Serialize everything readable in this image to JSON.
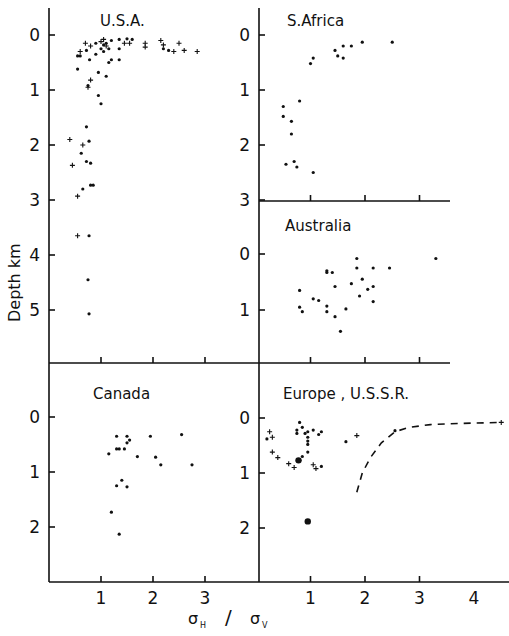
{
  "chart_data": {
    "type": "scatter",
    "title": "",
    "xlabel": "σH / σV",
    "ylabel": "Depth km",
    "marker_legend": {
      "dot": "measurement (•)",
      "cross": "measurement (+)"
    },
    "panels": [
      {
        "name": "U.S.A.",
        "xlim": [
          0,
          3.8
        ],
        "ylim": [
          0,
          6
        ],
        "xticks": [
          1,
          2,
          3
        ],
        "yticks": [
          0,
          1,
          2,
          3,
          4,
          5
        ],
        "dots": [
          [
            0.55,
            0.38
          ],
          [
            0.6,
            0.38
          ],
          [
            0.72,
            0.28
          ],
          [
            0.78,
            0.45
          ],
          [
            0.9,
            0.35
          ],
          [
            1.05,
            0.3
          ],
          [
            1.0,
            0.25
          ],
          [
            1.1,
            0.15
          ],
          [
            1.2,
            0.1
          ],
          [
            1.35,
            0.08
          ],
          [
            1.5,
            0.07
          ],
          [
            1.6,
            0.08
          ],
          [
            1.15,
            0.5
          ],
          [
            1.2,
            0.45
          ],
          [
            1.35,
            0.45
          ],
          [
            0.55,
            0.62
          ],
          [
            0.75,
            0.92
          ],
          [
            0.95,
            0.68
          ],
          [
            1.1,
            0.75
          ],
          [
            0.95,
            1.1
          ],
          [
            1.0,
            1.25
          ],
          [
            0.72,
            1.67
          ],
          [
            0.77,
            1.93
          ],
          [
            0.62,
            2.15
          ],
          [
            0.72,
            2.3
          ],
          [
            0.8,
            2.33
          ],
          [
            0.65,
            2.8
          ],
          [
            0.8,
            2.73
          ],
          [
            0.85,
            2.73
          ],
          [
            0.77,
            3.65
          ],
          [
            0.75,
            4.45
          ],
          [
            0.77,
            5.07
          ],
          [
            1.15,
            0.25
          ],
          [
            1.35,
            0.25
          ],
          [
            0.9,
            0.15
          ],
          [
            1.05,
            0.18
          ],
          [
            2.2,
            0.25
          ],
          [
            2.3,
            0.28
          ]
        ],
        "crosses": [
          [
            0.6,
            0.3
          ],
          [
            0.7,
            0.15
          ],
          [
            0.8,
            0.2
          ],
          [
            1.0,
            0.12
          ],
          [
            1.05,
            0.08
          ],
          [
            1.1,
            0.2
          ],
          [
            1.45,
            0.15
          ],
          [
            1.55,
            0.15
          ],
          [
            1.85,
            0.15
          ],
          [
            1.85,
            0.22
          ],
          [
            2.15,
            0.1
          ],
          [
            2.2,
            0.18
          ],
          [
            2.4,
            0.3
          ],
          [
            2.5,
            0.15
          ],
          [
            2.6,
            0.28
          ],
          [
            2.85,
            0.3
          ],
          [
            0.8,
            0.82
          ],
          [
            0.75,
            0.95
          ],
          [
            0.4,
            1.9
          ],
          [
            0.65,
            2.0
          ],
          [
            0.45,
            2.37
          ],
          [
            0.55,
            2.93
          ],
          [
            0.55,
            3.65
          ]
        ]
      },
      {
        "name": "S.Africa",
        "xlim": [
          0,
          3.5
        ],
        "ylim": [
          0,
          3
        ],
        "xticks": [
          1,
          2,
          3
        ],
        "yticks": [
          0,
          1,
          2,
          3
        ],
        "dots": [
          [
            0.5,
            1.3
          ],
          [
            0.5,
            1.48
          ],
          [
            0.65,
            1.57
          ],
          [
            0.65,
            1.8
          ],
          [
            0.8,
            1.2
          ],
          [
            1.0,
            0.52
          ],
          [
            1.05,
            0.42
          ],
          [
            1.45,
            0.28
          ],
          [
            1.5,
            0.38
          ],
          [
            1.6,
            0.2
          ],
          [
            1.6,
            0.42
          ],
          [
            1.75,
            0.2
          ],
          [
            1.95,
            0.13
          ],
          [
            2.5,
            0.13
          ],
          [
            0.55,
            2.35
          ],
          [
            0.7,
            2.3
          ],
          [
            0.75,
            2.4
          ],
          [
            1.05,
            2.5
          ]
        ],
        "crosses": []
      },
      {
        "name": "Australia",
        "xlim": [
          0,
          3.5
        ],
        "ylim": [
          0,
          1.8
        ],
        "xticks": [
          1,
          2,
          3
        ],
        "yticks": [
          0,
          1
        ],
        "dots": [
          [
            0.8,
            0.65
          ],
          [
            0.8,
            0.95
          ],
          [
            0.85,
            1.03
          ],
          [
            1.05,
            0.8
          ],
          [
            1.15,
            0.83
          ],
          [
            1.3,
            0.3
          ],
          [
            1.3,
            0.33
          ],
          [
            1.4,
            0.33
          ],
          [
            1.45,
            0.58
          ],
          [
            1.3,
            0.93
          ],
          [
            1.3,
            1.03
          ],
          [
            1.45,
            1.12
          ],
          [
            1.55,
            1.38
          ],
          [
            1.65,
            0.98
          ],
          [
            1.75,
            0.53
          ],
          [
            1.85,
            0.08
          ],
          [
            1.85,
            0.25
          ],
          [
            1.9,
            0.75
          ],
          [
            1.95,
            0.45
          ],
          [
            2.05,
            0.63
          ],
          [
            2.15,
            0.25
          ],
          [
            2.15,
            0.58
          ],
          [
            2.15,
            0.85
          ],
          [
            2.45,
            0.25
          ],
          [
            3.3,
            0.08
          ]
        ],
        "crosses": []
      },
      {
        "name": "Canada",
        "xlim": [
          0,
          3.8
        ],
        "ylim": [
          0,
          3
        ],
        "xticks": [
          1,
          2,
          3
        ],
        "yticks": [
          0,
          1,
          2
        ],
        "dots": [
          [
            1.3,
            0.35
          ],
          [
            1.5,
            0.35
          ],
          [
            1.55,
            0.42
          ],
          [
            1.5,
            0.47
          ],
          [
            1.3,
            0.58
          ],
          [
            1.35,
            0.58
          ],
          [
            1.45,
            0.58
          ],
          [
            1.15,
            0.67
          ],
          [
            1.7,
            0.72
          ],
          [
            1.95,
            0.35
          ],
          [
            2.05,
            0.73
          ],
          [
            2.15,
            0.87
          ],
          [
            2.55,
            0.32
          ],
          [
            2.75,
            0.87
          ],
          [
            1.4,
            1.15
          ],
          [
            1.3,
            1.25
          ],
          [
            1.5,
            1.27
          ],
          [
            1.2,
            1.73
          ],
          [
            1.35,
            2.13
          ]
        ],
        "crosses": []
      },
      {
        "name": "Europe , U.S.S.R.",
        "xlim": [
          0,
          4.6
        ],
        "ylim": [
          0,
          3
        ],
        "xticks": [
          1,
          2,
          3,
          4
        ],
        "yticks": [
          0,
          1,
          2
        ],
        "dots": [
          [
            0.2,
            0.38
          ],
          [
            0.75,
            0.22
          ],
          [
            0.8,
            0.08
          ],
          [
            0.85,
            0.17
          ],
          [
            0.75,
            0.28
          ],
          [
            0.95,
            0.25
          ],
          [
            1.05,
            0.22
          ],
          [
            0.9,
            0.28
          ],
          [
            0.95,
            0.35
          ],
          [
            1.15,
            0.3
          ],
          [
            1.2,
            0.25
          ],
          [
            0.95,
            0.42
          ],
          [
            0.95,
            0.48
          ],
          [
            0.95,
            0.62
          ],
          [
            0.85,
            0.7
          ],
          [
            0.8,
            0.77
          ],
          [
            0.78,
            0.78
          ],
          [
            1.2,
            0.88
          ],
          [
            1.65,
            0.43
          ],
          [
            2.55,
            0.23
          ],
          [
            0.95,
            1.88
          ]
        ],
        "big_dots": [
          [
            0.78,
            0.77
          ],
          [
            0.95,
            1.88
          ]
        ],
        "crosses": [
          [
            0.25,
            0.25
          ],
          [
            0.3,
            0.35
          ],
          [
            0.3,
            0.62
          ],
          [
            0.4,
            0.72
          ],
          [
            0.6,
            0.83
          ],
          [
            0.7,
            0.9
          ],
          [
            1.05,
            0.85
          ],
          [
            1.1,
            0.92
          ],
          [
            1.85,
            0.32
          ],
          [
            4.5,
            0.08
          ]
        ],
        "dashed_curve": [
          [
            1.85,
            1.35
          ],
          [
            1.95,
            1.0
          ],
          [
            2.1,
            0.72
          ],
          [
            2.3,
            0.45
          ],
          [
            2.55,
            0.25
          ],
          [
            2.8,
            0.17
          ],
          [
            3.2,
            0.12
          ],
          [
            3.7,
            0.1
          ],
          [
            4.5,
            0.08
          ]
        ]
      }
    ]
  },
  "labels": {
    "usa": "U.S.A.",
    "safrica": "S.Africa",
    "australia": "Australia",
    "canada": "Canada",
    "europe": "Europe , U.S.S.R.",
    "ylabel": "Depth   km",
    "sigma_h": "σ",
    "sub_h": "H",
    "slash": "/",
    "sigma_v": "σ",
    "sub_v": "V"
  }
}
